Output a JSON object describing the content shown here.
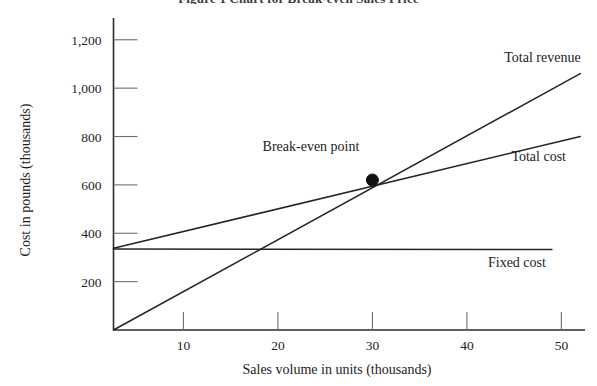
{
  "figure": {
    "title": "Figure 1 Chart for Break-even Sales Price",
    "title_clipped": true
  },
  "chart_data": {
    "type": "line",
    "title": "Figure 1 Chart for Break-even Sales Price",
    "xlabel": "Sales volume in units (thousands)",
    "ylabel": "Cost in pounds (thousands)",
    "xlim": [
      2.6,
      52.5
    ],
    "ylim": [
      0,
      1290
    ],
    "xticks": [
      10,
      20,
      30,
      40,
      50
    ],
    "xtick_labels": [
      "10",
      "20",
      "30",
      "40",
      "50"
    ],
    "yticks": [
      200,
      400,
      600,
      800,
      1000,
      1200
    ],
    "ytick_labels": [
      "200",
      "400",
      "600",
      "800",
      "1,000",
      "1,200"
    ],
    "grid": false,
    "legend_position": "inline-right",
    "series": [
      {
        "name": "Total revenue",
        "label": "Total revenue",
        "x": [
          2.6,
          52.0
        ],
        "y": [
          0,
          1060
        ],
        "label_x": 48.0,
        "label_y": 1110
      },
      {
        "name": "Total cost",
        "label": "Total cost",
        "x": [
          2.6,
          52.0
        ],
        "y": [
          338,
          800
        ],
        "label_x": 47.6,
        "label_y": 700
      },
      {
        "name": "Fixed cost",
        "label": "Fixed cost",
        "x": [
          2.6,
          49.0
        ],
        "y": [
          335,
          333
        ],
        "label_x": 45.3,
        "label_y": 262
      }
    ],
    "annotations": [
      {
        "name": "break-even-point",
        "text": "Break-even point",
        "point_x": 30,
        "point_y": 620,
        "label_x": 23.5,
        "label_y": 740,
        "marker": "filled-circle",
        "marker_radius": 6
      }
    ]
  },
  "colors": {
    "background": "#ffffff",
    "line": "#24242a",
    "axis": "#2b2b2b",
    "tick": "#6e6e6e",
    "text": "#1c1c1c",
    "marker": "#111114"
  }
}
